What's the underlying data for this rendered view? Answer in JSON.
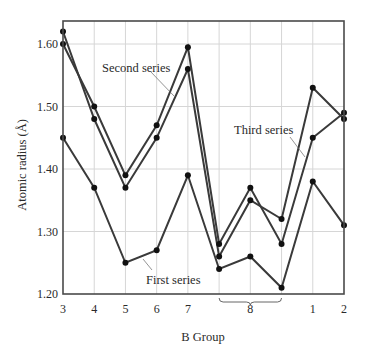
{
  "chart_data": {
    "type": "line",
    "title": "",
    "xlabel": "B Group",
    "ylabel": "Atomic radius (Å)",
    "ylim": [
      1.2,
      1.64
    ],
    "yticks": [
      "1.20",
      "1.30",
      "1.40",
      "1.50",
      "1.60"
    ],
    "ytick_values": [
      1.2,
      1.3,
      1.4,
      1.5,
      1.6
    ],
    "categories": [
      "3",
      "4",
      "5",
      "6",
      "7",
      "8",
      "8",
      "8",
      "1",
      "2"
    ],
    "x_tick_labels": [
      {
        "label": "3",
        "index": 0
      },
      {
        "label": "4",
        "index": 1
      },
      {
        "label": "5",
        "index": 2
      },
      {
        "label": "6",
        "index": 3
      },
      {
        "label": "7",
        "index": 4
      },
      {
        "label": "8",
        "index": 6,
        "bracket": [
          5,
          7
        ]
      },
      {
        "label": "1",
        "index": 8
      },
      {
        "label": "2",
        "index": 9
      }
    ],
    "grid": true,
    "legend": "inline annotations",
    "series": [
      {
        "name": "First series",
        "values": [
          1.45,
          1.37,
          1.25,
          1.27,
          1.39,
          1.24,
          1.26,
          1.21,
          1.38,
          1.31
        ]
      },
      {
        "name": "Second series",
        "values": [
          1.62,
          1.48,
          1.37,
          1.45,
          1.56,
          1.26,
          1.35,
          1.32,
          1.53,
          1.48
        ]
      },
      {
        "name": "Third series",
        "values": [
          1.6,
          1.5,
          1.39,
          1.47,
          1.595,
          1.28,
          1.37,
          1.28,
          1.45,
          1.49
        ]
      }
    ],
    "annotations": [
      {
        "text": "Second series",
        "x": 102,
        "y": 72,
        "arrow": [
          [
            150,
            71
          ],
          [
            174,
            96
          ]
        ]
      },
      {
        "text": "Third series",
        "x": 234,
        "y": 134,
        "arrow": [
          [
            290,
            137
          ],
          [
            305,
            157
          ]
        ]
      },
      {
        "text": "First series",
        "x": 146,
        "y": 284,
        "arrow": [
          [
            152,
            270
          ],
          [
            143,
            259
          ]
        ]
      }
    ],
    "colors": {
      "line": "#3a3a3a",
      "grid": "#d6d6d6",
      "frame": "#4a4a4a",
      "marker": "#111111"
    }
  }
}
